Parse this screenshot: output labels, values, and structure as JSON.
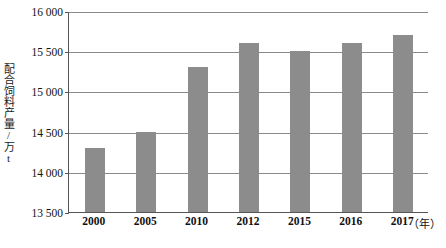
{
  "chart_data": {
    "type": "bar",
    "title": "",
    "subtitle": "",
    "xlabel": "年",
    "ylabel": "配合饲料产量/万t",
    "categories": [
      "2000",
      "2005",
      "2010",
      "2012",
      "2015",
      "2016",
      "2017"
    ],
    "values": [
      14300,
      14500,
      15300,
      15600,
      15500,
      15600,
      15700
    ],
    "series": [
      {
        "name": "配合饲料产量",
        "values": [
          14300,
          14500,
          15300,
          15600,
          15500,
          15600,
          15700
        ]
      }
    ],
    "ylim": [
      13500,
      16000
    ],
    "y_ticks": [
      13500,
      14000,
      14500,
      15000,
      15500,
      16000
    ],
    "y_tick_labels": [
      "13 500",
      "14 000",
      "14 500",
      "15 000",
      "15 500",
      "16 000"
    ],
    "grid": true,
    "grid_axis": "y",
    "legend": false,
    "legend_position": "none",
    "bar_color": "#8c8c8c",
    "axis_color": "#555555",
    "gridline_color": "#8a8a8a",
    "background": "#ffffff"
  },
  "axis": {
    "x_unit_label": "（年）",
    "y_title": "配合饲料产量/万t"
  }
}
